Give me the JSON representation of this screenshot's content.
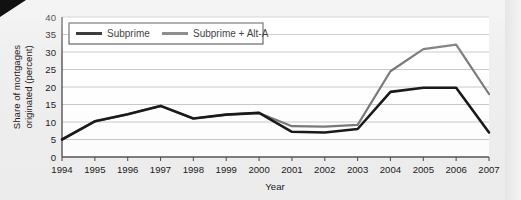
{
  "chart_data": {
    "type": "line",
    "title": "",
    "xlabel": "Year",
    "ylabel": "Share of mortgages originated (percent)",
    "ylabel_line1": "Share of mortgages",
    "ylabel_line2": "originated (percent)",
    "x": [
      1994,
      1995,
      1996,
      1997,
      1998,
      1999,
      2000,
      2001,
      2002,
      2003,
      2004,
      2005,
      2006,
      2007
    ],
    "categories": [
      "1994",
      "1995",
      "1996",
      "1997",
      "1998",
      "1999",
      "2000",
      "2001",
      "2002",
      "2003",
      "2004",
      "2005",
      "2006",
      "2007"
    ],
    "xlim": [
      1994,
      2007
    ],
    "ylim": [
      0,
      40
    ],
    "yticks": [
      0,
      5,
      10,
      15,
      20,
      25,
      30,
      35,
      40
    ],
    "ytick_labels": [
      "0",
      "5",
      "10",
      "15",
      "20",
      "25",
      "30",
      "35",
      "40"
    ],
    "grid": true,
    "grid_axis": "y",
    "legend_position": "top-left",
    "series": [
      {
        "name": "Subprime",
        "color": "#1a1a1a",
        "width": 2.6,
        "values": [
          5.0,
          10.2,
          12.2,
          14.6,
          11.0,
          12.1,
          12.6,
          7.2,
          7.0,
          8.0,
          18.6,
          19.8,
          19.8,
          7.0
        ]
      },
      {
        "name": "Subprime + Alt-A",
        "color": "#7a7a7a",
        "width": 2.2,
        "values": [
          5.0,
          10.2,
          12.2,
          14.6,
          11.0,
          12.1,
          12.6,
          8.8,
          8.7,
          9.2,
          24.5,
          30.8,
          32.1,
          18.0
        ]
      }
    ],
    "legend": [
      {
        "label": "Subprime",
        "color": "#1a1a1a"
      },
      {
        "label": "Subprime + Alt-A",
        "color": "#7a7a7a"
      }
    ],
    "colors": {
      "background": "#efefef",
      "plot_background": "#ffffff",
      "axis": "#3a3a3a",
      "grid": "#c8c8c8",
      "subprime": "#1a1a1a",
      "subprime_alt_a": "#7a7a7a"
    }
  }
}
